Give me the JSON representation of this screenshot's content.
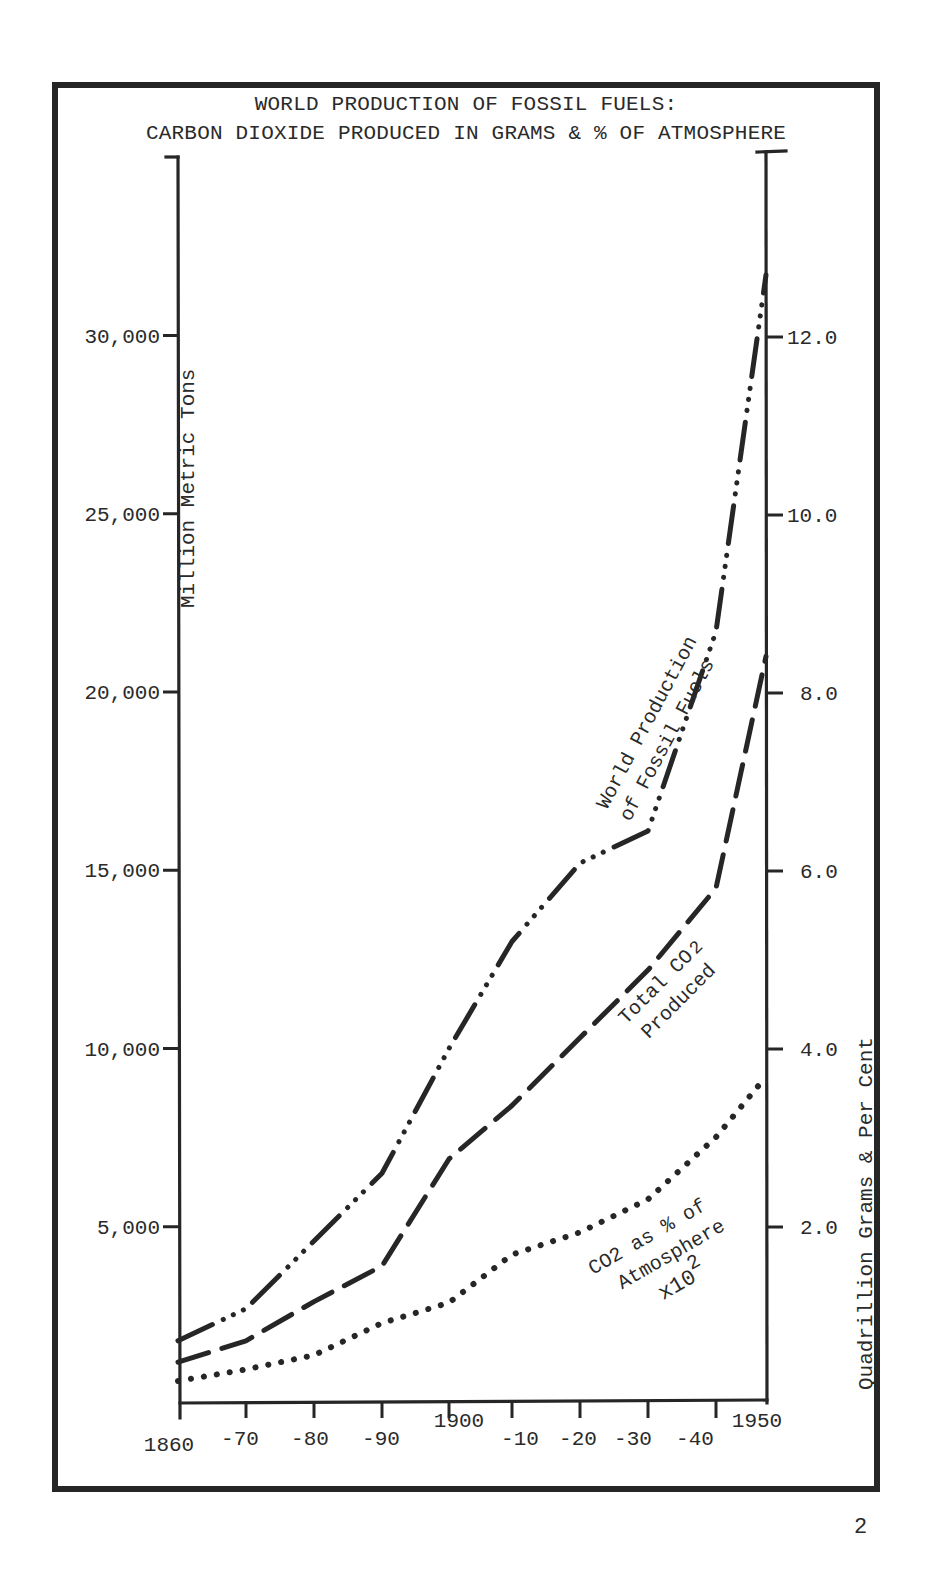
{
  "title": {
    "line1": "WORLD PRODUCTION OF FOSSIL FUELS:",
    "line2": "CARBON DIOXIDE PRODUCED IN GRAMS & % OF ATMOSPHERE"
  },
  "axes": {
    "left_label": "Million Metric Tons",
    "right_label": "Quadrillion Grams & Per Cent",
    "left_ticks": [
      "5,000",
      "10,000",
      "15,000",
      "20,000",
      "25,000",
      "30,000"
    ],
    "right_ticks": [
      "2.0",
      "4.0",
      "6.0",
      "8.0",
      "10.0",
      "12.0"
    ],
    "x_ticks": [
      "1860",
      "-70",
      "-80",
      "-90",
      "1900",
      "-10",
      "-20",
      "-30",
      "-40",
      "1950"
    ]
  },
  "labels": {
    "fossil_line1": "World Production",
    "fossil_line2": "of Fossil Fuels",
    "co2_line1": "Total CO",
    "co2_sub": "2",
    "co2_line2": "Produced",
    "atm_line1a": "CO",
    "atm_line1b": "2 as % of",
    "atm_line2": "Atmosphere",
    "atm_line3": "x10",
    "atm_sup": "2"
  },
  "page_number": "2",
  "chart_data": {
    "type": "line",
    "title": "WORLD PRODUCTION OF FOSSIL FUELS: CARBON DIOXIDE PRODUCED IN GRAMS & % OF ATMOSPHERE",
    "xlabel": "",
    "ylabel": "Million Metric Tons",
    "ylabel_right": "Quadrillion Grams & Per Cent",
    "x": [
      1860,
      1870,
      1880,
      1890,
      1900,
      1910,
      1920,
      1930,
      1940,
      1950
    ],
    "ylim": [
      0,
      35000
    ],
    "ylim_right": [
      0,
      14.0
    ],
    "grid": false,
    "legend": "inline labels along curves",
    "series": [
      {
        "name": "World Production of Fossil Fuels",
        "axis": "left",
        "style": "dash-dot-dot",
        "values": [
          1800,
          2700,
          4600,
          6500,
          10000,
          13000,
          15200,
          16100,
          21700,
          31700
        ]
      },
      {
        "name": "Total CO2 Produced",
        "axis": "left",
        "style": "dashed",
        "values": [
          1200,
          1800,
          2900,
          3900,
          6900,
          8400,
          10300,
          12200,
          14500,
          21000
        ]
      },
      {
        "name": "CO2 as % of Atmosphere x10^2",
        "axis": "right",
        "style": "dotted",
        "values": [
          0.27,
          0.4,
          0.56,
          0.92,
          1.15,
          1.69,
          1.94,
          2.31,
          3.01,
          3.69
        ]
      }
    ]
  }
}
